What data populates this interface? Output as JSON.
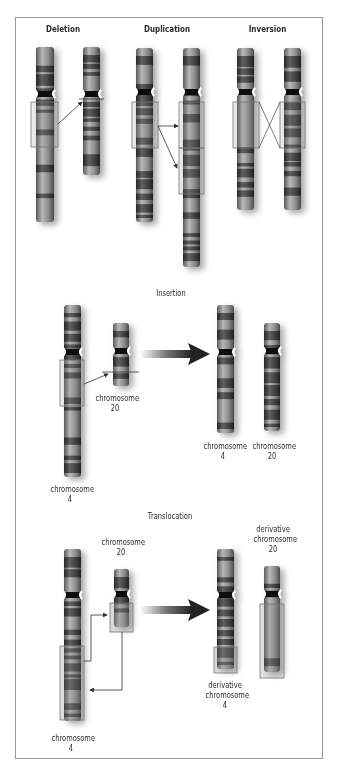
{
  "figure": {
    "sections": {
      "deletion": {
        "title": "Deletion"
      },
      "duplication": {
        "title": "Duplication"
      },
      "inversion": {
        "title": "Inversion"
      },
      "insertion": {
        "title": "Insertion",
        "before": {
          "chr4": [
            "chromosome",
            "4"
          ],
          "chr20": [
            "chromosome",
            "20"
          ]
        },
        "after": {
          "chr4": [
            "chromosome",
            "4"
          ],
          "chr20": [
            "chromosome",
            "20"
          ]
        }
      },
      "translocation": {
        "title": "Translocation",
        "before": {
          "chr4": [
            "chromosome",
            "4"
          ],
          "chr20": [
            "chromosome",
            "20"
          ]
        },
        "after": {
          "chr4": [
            "derivative",
            "chromosome",
            "4"
          ],
          "chr20": [
            "derivative",
            "chromosome",
            "20"
          ]
        }
      }
    },
    "colors": {
      "frame": "#9a9a9a",
      "chromosome_dark": "#3a3a3a",
      "chromosome_light": "#9c9c9c",
      "box": "#8a8a8a"
    }
  }
}
